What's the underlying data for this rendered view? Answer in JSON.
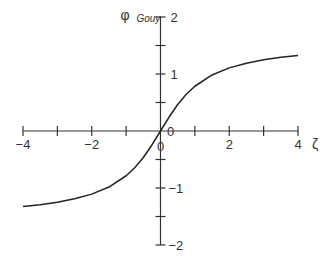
{
  "chart_data": {
    "type": "line",
    "title": "",
    "xlabel": "ζ",
    "ylabel": "φ",
    "ylabel_subscript": "Gouy",
    "xlim": [
      -4,
      4
    ],
    "ylim": [
      -2,
      2
    ],
    "grid": false,
    "legend": "none",
    "x_ticks": [
      -4,
      -3,
      -2,
      -1,
      0,
      1,
      2,
      3,
      4
    ],
    "x_tick_labels": [
      {
        "value": -4,
        "label": "−4"
      },
      {
        "value": -2,
        "label": "−2"
      },
      {
        "value": 0,
        "label": "0"
      },
      {
        "value": 2,
        "label": "2"
      },
      {
        "value": 4,
        "label": "4"
      }
    ],
    "y_ticks": [
      -2,
      -1.5,
      -1,
      -0.5,
      0,
      0.5,
      1,
      1.5,
      2
    ],
    "y_tick_labels": [
      {
        "value": 2,
        "label": "2"
      },
      {
        "value": 1,
        "label": "1"
      },
      {
        "value": 0,
        "label": "0"
      },
      {
        "value": -1,
        "label": "−1"
      },
      {
        "value": -2,
        "label": "−2"
      }
    ],
    "series": [
      {
        "name": "φ_Gouy = arctan(ζ)",
        "x": [
          -4,
          -3.5,
          -3,
          -2.5,
          -2,
          -1.5,
          -1,
          -0.75,
          -0.5,
          -0.25,
          0,
          0.25,
          0.5,
          0.75,
          1,
          1.5,
          2,
          2.5,
          3,
          3.5,
          4
        ],
        "y": [
          -1.326,
          -1.292,
          -1.249,
          -1.19,
          -1.107,
          -0.983,
          -0.785,
          -0.644,
          -0.464,
          -0.245,
          0,
          0.245,
          0.464,
          0.644,
          0.785,
          0.983,
          1.107,
          1.19,
          1.249,
          1.292,
          1.326
        ]
      }
    ],
    "colors": {
      "axis": "#333333",
      "curve": "#222222"
    }
  }
}
